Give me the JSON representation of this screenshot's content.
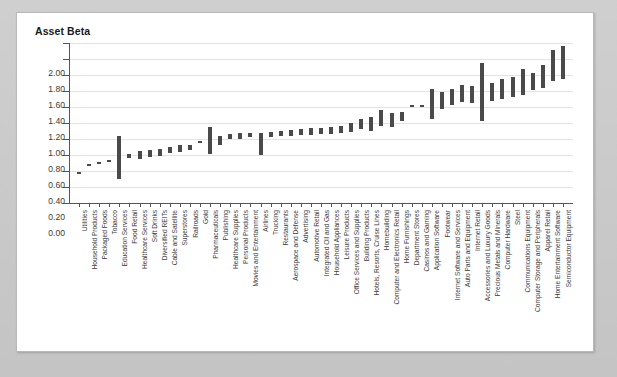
{
  "chart_data": {
    "type": "bar",
    "title": "Asset Beta",
    "xlabel": "",
    "ylabel": "Asset Beta",
    "ylim": [
      0.0,
      2.0
    ],
    "ytick_step": 0.2,
    "ytick_labels": [
      "2.00",
      "1.80",
      "1.60",
      "1.40",
      "1.20",
      "1.00",
      "0.80",
      "0.60",
      "0.40",
      "0.20",
      "0.00"
    ],
    "grid": true,
    "legend": null,
    "note": "Floating range bars: each industry shows a low-to-high asset beta interval.",
    "bar_color": "#4a4a4a",
    "categories": [
      "Utilities",
      "Household Products",
      "Packaged Foods",
      "Tobacco",
      "Education Services",
      "Food Retail",
      "Healthcare Services",
      "Soft Drinks",
      "Diversified REITs",
      "Cable and Satellite",
      "Superstores",
      "Railroads",
      "Gold",
      "Pharmaceuticals",
      "Publishing",
      "Healthcare Supplies",
      "Personal Products",
      "Movies and Entertainment",
      "Airlines",
      "Trucking",
      "Restaurants",
      "Aerospace and Defense",
      "Advertising",
      "Automotive Retail",
      "Integrated Oil and Gas",
      "Household Appliances",
      "Leisure Products",
      "Office Services and Supplies",
      "Building Products",
      "Hotels, Resorts, Cruise Lines",
      "Homebuilding",
      "Computer and Electronics Retail",
      "Home Furnishings",
      "Department Stores",
      "Casinos and Gaming",
      "Application Software",
      "Footwear",
      "Internet Software and Services",
      "Auto Parts and Equipment",
      "Internet Retail",
      "Accessories and Luxury Goods",
      "Precious Metals and Minerals",
      "Computer Hardware",
      "Steel",
      "Communications Equipment",
      "Computer Storage and Peripherals",
      "Apparel Retail",
      "Home Entertainment Software",
      "Semiconductor Equipment"
    ],
    "low": [
      0.37,
      0.47,
      0.49,
      0.51,
      0.3,
      0.56,
      0.55,
      0.57,
      0.59,
      0.62,
      0.64,
      0.66,
      0.76,
      0.61,
      0.73,
      0.8,
      0.8,
      0.82,
      0.6,
      0.82,
      0.84,
      0.84,
      0.85,
      0.85,
      0.86,
      0.86,
      0.87,
      0.89,
      0.92,
      0.9,
      0.96,
      0.95,
      1.02,
      1.21,
      1.21,
      1.05,
      1.18,
      1.22,
      1.26,
      1.25,
      1.03,
      1.27,
      1.3,
      1.33,
      1.35,
      1.41,
      1.44,
      1.53,
      1.55
    ],
    "high": [
      0.39,
      0.49,
      0.51,
      0.54,
      0.84,
      0.61,
      0.65,
      0.66,
      0.68,
      0.7,
      0.72,
      0.73,
      0.78,
      0.95,
      0.84,
      0.86,
      0.87,
      0.88,
      0.87,
      0.89,
      0.9,
      0.91,
      0.93,
      0.94,
      0.94,
      0.95,
      0.96,
      1.0,
      1.05,
      1.08,
      1.16,
      1.12,
      1.14,
      1.23,
      1.23,
      1.43,
      1.39,
      1.42,
      1.47,
      1.46,
      1.75,
      1.5,
      1.55,
      1.58,
      1.67,
      1.63,
      1.72,
      1.91,
      1.96
    ]
  },
  "icons": {
    "chart_area": "bar-chart-icon"
  }
}
